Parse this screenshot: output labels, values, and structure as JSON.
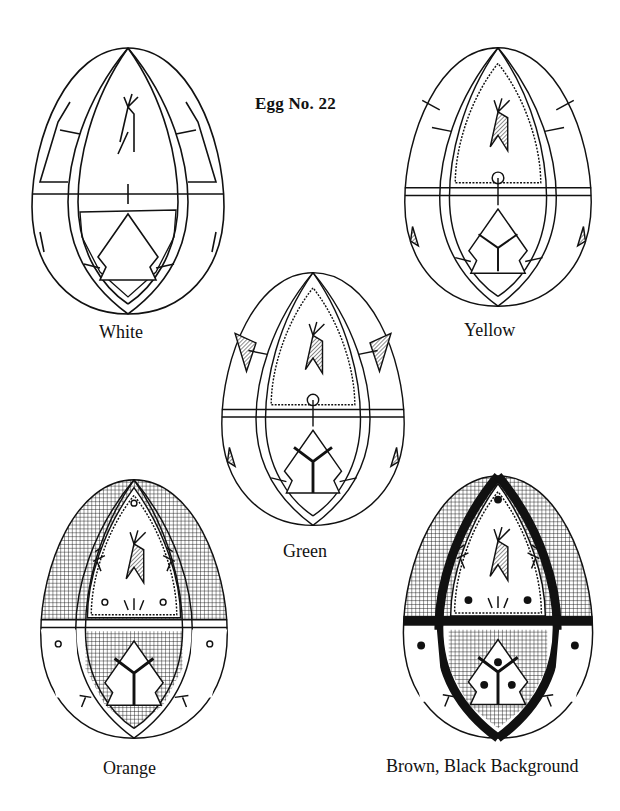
{
  "page": {
    "title": "Egg No. 22",
    "background": "#ffffff",
    "ink": "#111111"
  },
  "eggs": [
    {
      "label": "White",
      "stage": 1,
      "fill": "none",
      "motifs": [
        "deer",
        "tree",
        "crosses"
      ]
    },
    {
      "label": "Yellow",
      "stage": 2,
      "fill": "none",
      "motifs": [
        "deer-hatched",
        "tree-fronds",
        "wavy-border"
      ]
    },
    {
      "label": "Green",
      "stage": 3,
      "fill": "none",
      "motifs": [
        "deer-hatched",
        "tree-branches",
        "wavy-border"
      ]
    },
    {
      "label": "Orange",
      "stage": 4,
      "fill": "crosshatch",
      "motifs": [
        "deer-hatched",
        "tree-branches",
        "dots-open",
        "sprigs",
        "crosshatch-panels"
      ]
    },
    {
      "label": "Brown, Black Background",
      "stage": 5,
      "fill": "black-bands",
      "motifs": [
        "deer-hatched",
        "tree-branches",
        "dots-filled",
        "sprigs",
        "crosshatch-panels",
        "black-bands"
      ]
    }
  ]
}
